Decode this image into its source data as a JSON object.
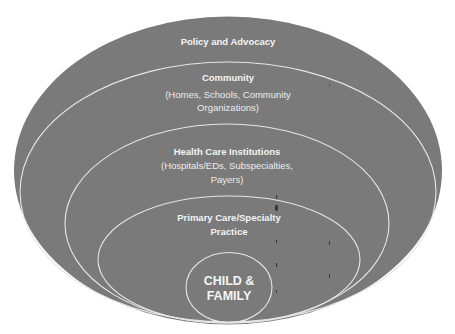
{
  "diagram": {
    "type": "nested-ellipses",
    "colors": {
      "fill": "#7a7a7a",
      "outline": "#e6e6e6",
      "text": "#f4f4f4",
      "background": "#ffffff"
    },
    "layers": [
      {
        "id": "policy",
        "title": "Policy and Advocacy",
        "subtitle_lines": []
      },
      {
        "id": "community",
        "title": "Community",
        "subtitle_lines": [
          "(Homes, Schools, Community",
          "Organizations)"
        ]
      },
      {
        "id": "health-care",
        "title": "Health Care Institutions",
        "subtitle_lines": [
          "(Hospitals/EDs, Subspecialties,",
          "Payers)"
        ]
      },
      {
        "id": "primary-care",
        "title_lines": [
          "Primary Care/Specialty",
          "Practice"
        ]
      },
      {
        "id": "core",
        "title_lines": [
          "CHILD &",
          "FAMILY"
        ]
      }
    ]
  }
}
